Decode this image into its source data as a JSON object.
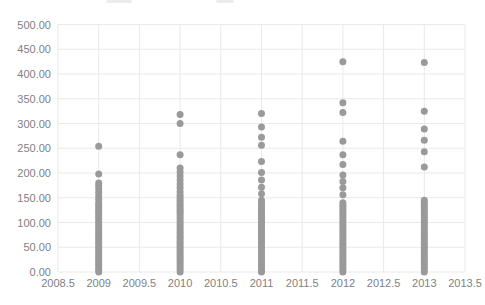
{
  "chart_data": {
    "type": "scatter",
    "xlabel": "",
    "ylabel": "",
    "xlim": [
      2008.5,
      2013.5
    ],
    "ylim": [
      0,
      500
    ],
    "grid": true,
    "x_ticks": [
      2008.5,
      2009,
      2009.5,
      2010,
      2010.5,
      2011,
      2011.5,
      2012,
      2012.5,
      2013,
      2013.5
    ],
    "x_tick_labels": [
      "2008.5",
      "2009",
      "2009.5",
      "2010",
      "2010.5",
      "2011",
      "2011.5",
      "2012",
      "2012.5",
      "2013",
      "2013.5"
    ],
    "y_ticks": [
      0,
      50,
      100,
      150,
      200,
      250,
      300,
      350,
      400,
      450,
      500
    ],
    "y_tick_labels": [
      "0.00",
      "50.00",
      "100.00",
      "150.00",
      "200.00",
      "250.00",
      "300.00",
      "350.00",
      "400.00",
      "450.00",
      "500.00"
    ],
    "legend": "none",
    "colors": {
      "dots": "#9a9a9a",
      "grid": "#e9e9e9",
      "labels": "#7f7f7f"
    },
    "series": [
      {
        "name": "2009",
        "x": 2009,
        "values": [
          0,
          5,
          10,
          15,
          20,
          25,
          30,
          35,
          40,
          45,
          50,
          55,
          60,
          65,
          70,
          75,
          80,
          85,
          90,
          95,
          100,
          105,
          110,
          115,
          120,
          125,
          130,
          135,
          140,
          147,
          154,
          161,
          168,
          174,
          180,
          198,
          254
        ]
      },
      {
        "name": "2010",
        "x": 2010,
        "values": [
          0,
          5,
          10,
          15,
          20,
          25,
          30,
          35,
          40,
          45,
          50,
          55,
          60,
          65,
          70,
          75,
          80,
          85,
          90,
          95,
          100,
          105,
          110,
          115,
          120,
          125,
          130,
          135,
          140,
          145,
          150,
          155,
          162,
          170,
          178,
          186,
          194,
          202,
          210,
          237,
          300,
          318
        ]
      },
      {
        "name": "2011",
        "x": 2011,
        "values": [
          0,
          5,
          10,
          15,
          20,
          25,
          30,
          35,
          40,
          45,
          50,
          55,
          60,
          65,
          70,
          75,
          80,
          85,
          90,
          95,
          100,
          105,
          110,
          115,
          120,
          125,
          130,
          135,
          140,
          145,
          158,
          171,
          186,
          201,
          223,
          256,
          272,
          293,
          320
        ]
      },
      {
        "name": "2012",
        "x": 2012,
        "values": [
          0,
          5,
          10,
          15,
          20,
          25,
          30,
          35,
          40,
          45,
          50,
          55,
          60,
          65,
          70,
          75,
          80,
          85,
          90,
          95,
          100,
          105,
          110,
          115,
          120,
          125,
          130,
          135,
          140,
          156,
          170,
          183,
          196,
          217,
          237,
          264,
          322,
          342,
          425
        ]
      },
      {
        "name": "2013",
        "x": 2013,
        "values": [
          0,
          5,
          10,
          15,
          20,
          25,
          30,
          35,
          40,
          45,
          50,
          55,
          60,
          65,
          70,
          75,
          80,
          85,
          90,
          95,
          100,
          105,
          110,
          115,
          120,
          125,
          130,
          135,
          140,
          145,
          212,
          243,
          266,
          289,
          325,
          423
        ]
      }
    ]
  }
}
